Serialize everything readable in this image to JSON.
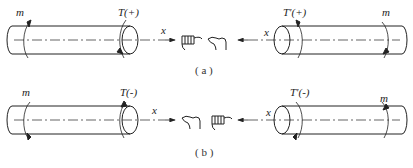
{
  "diagram": {
    "panels": [
      {
        "id": "a",
        "caption": "( a )",
        "left_shaft": {
          "moment_label": "m",
          "torque_label": "T(+)",
          "axis_label": "x"
        },
        "right_shaft": {
          "moment_label": "m",
          "torque_label": "T'(+)",
          "axis_label": "x"
        },
        "hands": [
          "right-hand-thumb-outward-icon",
          "right-hand-thumb-outward-icon"
        ],
        "sign": "+"
      },
      {
        "id": "b",
        "caption": "( b )",
        "left_shaft": {
          "moment_label": "m",
          "torque_label": "T(-)",
          "axis_label": "x"
        },
        "right_shaft": {
          "moment_label": "m",
          "torque_label": "T'(-)",
          "axis_label": "x"
        },
        "hands": [
          "right-hand-thumb-inward-icon",
          "right-hand-thumb-inward-icon"
        ],
        "sign": "-"
      }
    ],
    "colors": {
      "line": "#222222",
      "background": "#ffffff"
    }
  }
}
